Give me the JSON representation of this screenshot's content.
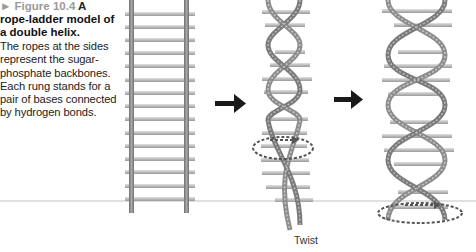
{
  "caption": {
    "marker": "►",
    "label": "Figure 10.4",
    "title_lead": "A",
    "title": "rope-ladder model of a double helix.",
    "body": "The ropes at the sides represent the sugar-phosphate backbones. Each rung stands for a pair of bases connected by hydrogen bonds."
  },
  "illustration": {
    "panels": [
      {
        "name": "straight-ladder",
        "description": "untwisted rope ladder"
      },
      {
        "name": "twisting-ladder",
        "description": "ladder being twisted into helix"
      },
      {
        "name": "double-helix",
        "description": "fully twisted double helix"
      }
    ],
    "arrows": [
      "right-arrow",
      "right-arrow"
    ],
    "twist_label": "Twist",
    "colors": {
      "rope": "#8a8a8a",
      "rope_light": "#c4c4c4",
      "rung": "#b8b8b8",
      "arrow": "#1a1a1a",
      "rotation_marker": "#555555",
      "divider": "#dddddd"
    }
  }
}
